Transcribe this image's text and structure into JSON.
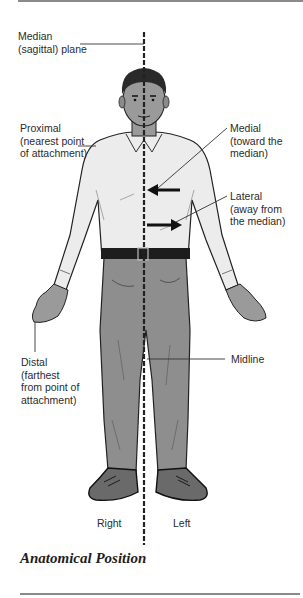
{
  "diagram": {
    "title": "Anatomical Position",
    "labels": {
      "median_plane": "Median\n(sagittal) plane",
      "proximal": "Proximal\n(nearest point\nof attachment)",
      "medial": "Medial\n(toward the\nmedian)",
      "lateral": "Lateral\n(away from\nthe median)",
      "distal": "Distal\n(farthest\nfrom point of\nattachment)",
      "midline": "Midline",
      "right": "Right",
      "left": "Left"
    },
    "colors": {
      "shirt": "#ececec",
      "pants": "#8e8e8e",
      "shoes": "#6a6a6a",
      "skin": "#9a9a9a",
      "hair": "#2a2a2a",
      "line": "#333333",
      "rule": "#8a8a8a"
    }
  }
}
